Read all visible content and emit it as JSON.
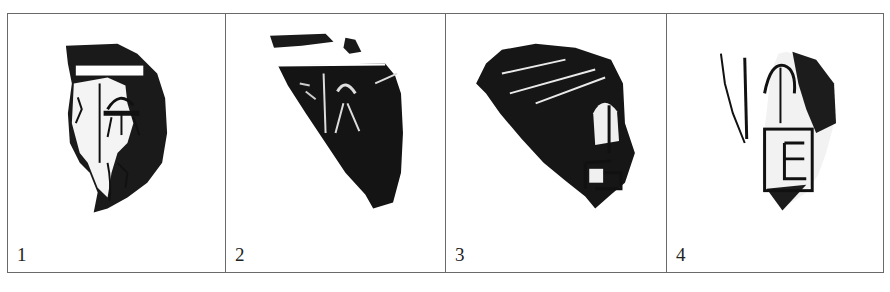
{
  "figure": {
    "panels": [
      {
        "label": "1",
        "subject": "ink rubbing of inscribed pottery sherd with rim band and incised characters"
      },
      {
        "label": "2",
        "subject": "ink rubbing of triangular pottery sherd, densely inked, with partial rim"
      },
      {
        "label": "3",
        "subject": "ink rubbing of pottery sherd with diagonal striations and partial character at lower right"
      },
      {
        "label": "4",
        "subject": "ink rubbing of pottery sherd with incised characters, lower character boxed"
      }
    ],
    "colors": {
      "ink": "#111111",
      "border": "#6a6a6a",
      "background": "#ffffff"
    }
  }
}
